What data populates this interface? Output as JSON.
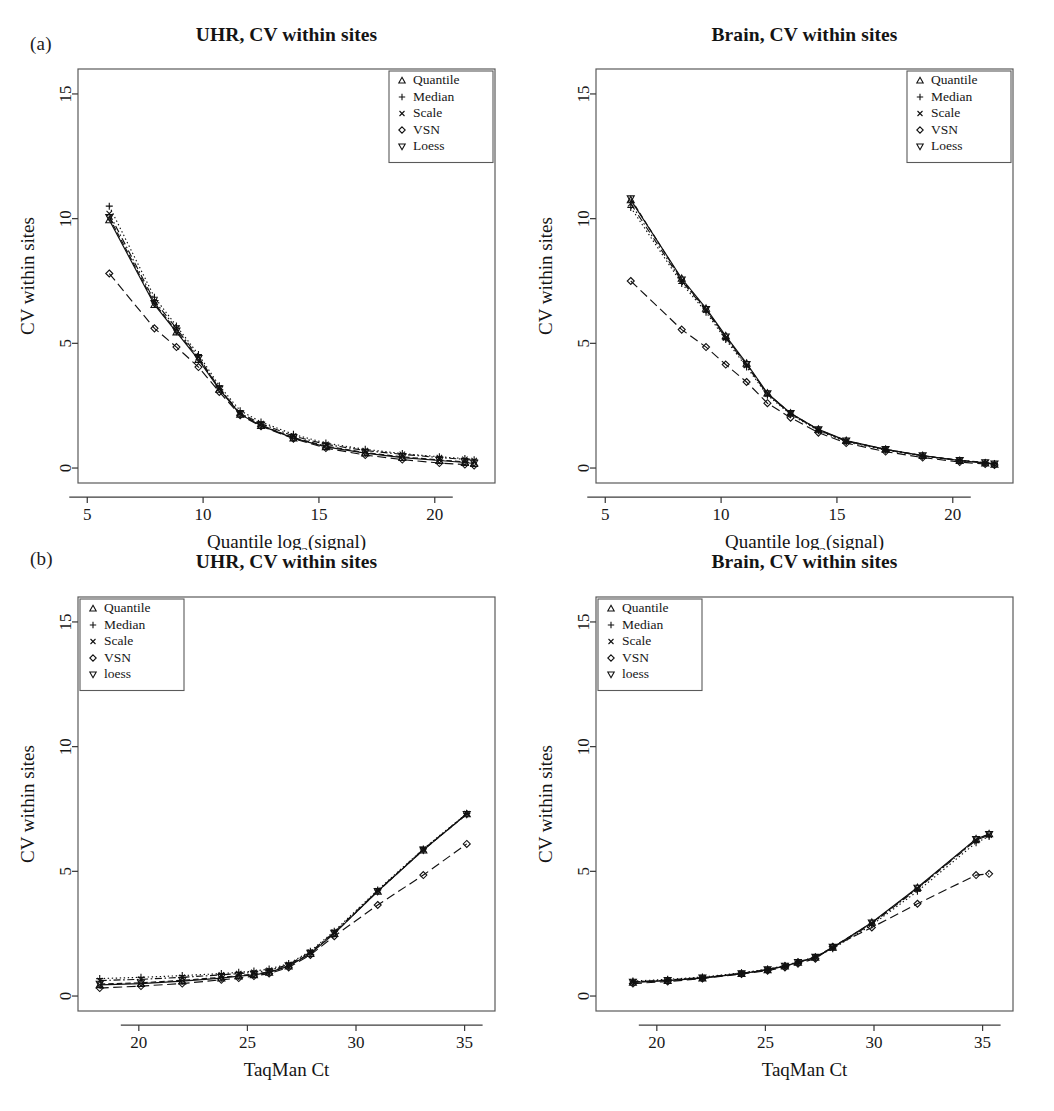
{
  "figure": {
    "panels": [
      {
        "tag": "(a)",
        "plots": [
          {
            "title": "UHR, CV within sites",
            "legend_position": "top-right",
            "chart_ref": 0
          },
          {
            "title": "Brain, CV within sites",
            "legend_position": "top-right",
            "chart_ref": 1
          }
        ]
      },
      {
        "tag": "(b)",
        "plots": [
          {
            "title": "UHR, CV within sites",
            "legend_position": "top-left",
            "chart_ref": 2
          },
          {
            "title": "Brain, CV within sites",
            "legend_position": "top-left",
            "chart_ref": 3
          }
        ]
      }
    ]
  },
  "axis_titles": {
    "y": "CV within sites",
    "x_panel_a_pre": "Quantile log",
    "x_panel_a_sub": "2",
    "x_panel_a_post": "(signal)",
    "x_panel_b": "TaqMan Ct"
  },
  "legend_glyphs": {
    "Quantile": "triangle-up",
    "Median": "plus",
    "Scale": "cross",
    "VSN": "diamond",
    "Loess": "triangle-down",
    "loess": "triangle-down"
  },
  "chart_data": [
    {
      "type": "line",
      "title": "UHR, CV within sites",
      "xlabel": "Quantile log2(signal)",
      "ylabel": "CV within sites",
      "xlim": [
        4.6,
        22.6
      ],
      "ylim": [
        -0.6,
        16.0
      ],
      "xticks": [
        5,
        10,
        15,
        20
      ],
      "yticks": [
        0,
        5,
        10,
        15
      ],
      "grid": false,
      "legend_position": "top-right",
      "series": [
        {
          "name": "Quantile",
          "marker": "triangle-up",
          "dash": "solid",
          "x": [
            5.95,
            7.9,
            8.85,
            9.8,
            10.7,
            11.6,
            12.5,
            13.9,
            15.3,
            17.0,
            18.6,
            20.2,
            21.3,
            21.7
          ],
          "y": [
            9.95,
            6.55,
            5.45,
            4.35,
            3.15,
            2.15,
            1.7,
            1.2,
            0.85,
            0.6,
            0.42,
            0.3,
            0.22,
            0.18
          ]
        },
        {
          "name": "Median",
          "marker": "plus",
          "dash": "dotted",
          "x": [
            5.95,
            7.9,
            8.85,
            9.8,
            10.7,
            11.6,
            12.5,
            13.9,
            15.3,
            17.0,
            18.6,
            20.2,
            21.3,
            21.7
          ],
          "y": [
            10.5,
            6.85,
            5.7,
            4.55,
            3.3,
            2.3,
            1.85,
            1.35,
            1.0,
            0.75,
            0.58,
            0.45,
            0.38,
            0.33
          ]
        },
        {
          "name": "Scale",
          "marker": "cross",
          "dash": "dashdot",
          "x": [
            5.95,
            7.9,
            8.85,
            9.8,
            10.7,
            11.6,
            12.5,
            13.9,
            15.3,
            17.0,
            18.6,
            20.2,
            21.3,
            21.7
          ],
          "y": [
            10.2,
            6.7,
            5.6,
            4.45,
            3.2,
            2.2,
            1.78,
            1.28,
            0.95,
            0.7,
            0.55,
            0.42,
            0.35,
            0.3
          ]
        },
        {
          "name": "VSN",
          "marker": "diamond",
          "dash": "longdash",
          "x": [
            5.95,
            7.9,
            8.85,
            9.8,
            10.7,
            11.6,
            12.5,
            13.9,
            15.3,
            17.0,
            18.6,
            20.2,
            21.3,
            21.7
          ],
          "y": [
            7.8,
            5.6,
            4.85,
            4.05,
            3.05,
            2.12,
            1.68,
            1.18,
            0.8,
            0.52,
            0.34,
            0.2,
            0.14,
            0.1
          ]
        },
        {
          "name": "Loess",
          "marker": "triangle-down",
          "dash": "dashed",
          "x": [
            5.95,
            7.9,
            8.85,
            9.8,
            10.7,
            11.6,
            12.5,
            13.9,
            15.3,
            17.0,
            18.6,
            20.2,
            21.3,
            21.7
          ],
          "y": [
            10.05,
            6.6,
            5.5,
            4.4,
            3.18,
            2.17,
            1.72,
            1.22,
            0.88,
            0.62,
            0.45,
            0.32,
            0.25,
            0.2
          ]
        }
      ]
    },
    {
      "type": "line",
      "title": "Brain, CV within sites",
      "xlabel": "Quantile log2(signal)",
      "ylabel": "CV within sites",
      "xlim": [
        4.6,
        22.6
      ],
      "ylim": [
        -0.6,
        16.0
      ],
      "xticks": [
        5,
        10,
        15,
        20
      ],
      "yticks": [
        0,
        5,
        10,
        15
      ],
      "grid": false,
      "legend_position": "top-right",
      "series": [
        {
          "name": "Quantile",
          "marker": "triangle-up",
          "dash": "solid",
          "x": [
            6.1,
            8.3,
            9.35,
            10.2,
            11.1,
            12.0,
            13.0,
            14.2,
            15.4,
            17.1,
            18.7,
            20.3,
            21.4,
            21.8
          ],
          "y": [
            10.75,
            7.6,
            6.4,
            5.3,
            4.2,
            3.0,
            2.2,
            1.55,
            1.1,
            0.75,
            0.5,
            0.3,
            0.2,
            0.15
          ]
        },
        {
          "name": "Median",
          "marker": "plus",
          "dash": "dotted",
          "x": [
            6.1,
            8.3,
            9.35,
            10.2,
            11.1,
            12.0,
            13.0,
            14.2,
            15.4,
            17.1,
            18.7,
            20.3,
            21.4,
            21.8
          ],
          "y": [
            10.45,
            7.4,
            6.25,
            5.15,
            4.05,
            2.92,
            2.15,
            1.5,
            1.05,
            0.72,
            0.48,
            0.3,
            0.22,
            0.18
          ]
        },
        {
          "name": "Scale",
          "marker": "cross",
          "dash": "dashdot",
          "x": [
            6.1,
            8.3,
            9.35,
            10.2,
            11.1,
            12.0,
            13.0,
            14.2,
            15.4,
            17.1,
            18.7,
            20.3,
            21.4,
            21.8
          ],
          "y": [
            10.6,
            7.5,
            6.33,
            5.22,
            4.12,
            2.96,
            2.18,
            1.52,
            1.08,
            0.74,
            0.49,
            0.3,
            0.21,
            0.16
          ]
        },
        {
          "name": "VSN",
          "marker": "diamond",
          "dash": "longdash",
          "x": [
            6.1,
            8.3,
            9.35,
            10.2,
            11.1,
            12.0,
            13.0,
            14.2,
            15.4,
            17.1,
            18.7,
            20.3,
            21.4,
            21.8
          ],
          "y": [
            7.5,
            5.55,
            4.85,
            4.15,
            3.45,
            2.6,
            2.02,
            1.42,
            1.0,
            0.66,
            0.42,
            0.24,
            0.16,
            0.12
          ]
        },
        {
          "name": "Loess",
          "marker": "triangle-down",
          "dash": "dashed",
          "x": [
            6.1,
            8.3,
            9.35,
            10.2,
            11.1,
            12.0,
            13.0,
            14.2,
            15.4,
            17.1,
            18.7,
            20.3,
            21.4,
            21.8
          ],
          "y": [
            10.8,
            7.55,
            6.36,
            5.26,
            4.16,
            2.98,
            2.19,
            1.54,
            1.09,
            0.75,
            0.5,
            0.31,
            0.22,
            0.17
          ]
        }
      ]
    },
    {
      "type": "line",
      "title": "UHR, CV within sites",
      "xlabel": "TaqMan Ct",
      "ylabel": "CV within sites",
      "xlim": [
        17.2,
        36.4
      ],
      "ylim": [
        -0.6,
        16.0
      ],
      "xticks": [
        20,
        25,
        30,
        35
      ],
      "yticks": [
        0,
        5,
        10,
        15
      ],
      "grid": false,
      "legend_position": "top-left",
      "series": [
        {
          "name": "Quantile",
          "marker": "triangle-up",
          "dash": "solid",
          "x": [
            18.2,
            20.1,
            22.0,
            23.8,
            24.6,
            25.3,
            26.0,
            26.9,
            27.9,
            29.0,
            31.0,
            33.1,
            35.1
          ],
          "y": [
            0.45,
            0.5,
            0.6,
            0.72,
            0.8,
            0.85,
            0.95,
            1.2,
            1.7,
            2.5,
            4.2,
            5.85,
            7.3
          ]
        },
        {
          "name": "Median",
          "marker": "plus",
          "dash": "dotted",
          "x": [
            18.2,
            20.1,
            22.0,
            23.8,
            24.6,
            25.3,
            26.0,
            26.9,
            27.9,
            29.0,
            31.0,
            33.1,
            35.1
          ],
          "y": [
            0.7,
            0.75,
            0.82,
            0.9,
            0.95,
            1.0,
            1.08,
            1.3,
            1.8,
            2.6,
            4.25,
            5.9,
            7.32
          ]
        },
        {
          "name": "Scale",
          "marker": "cross",
          "dash": "dashdot",
          "x": [
            18.2,
            20.1,
            22.0,
            23.8,
            24.6,
            25.3,
            26.0,
            26.9,
            27.9,
            29.0,
            31.0,
            33.1,
            35.1
          ],
          "y": [
            0.62,
            0.67,
            0.75,
            0.85,
            0.9,
            0.95,
            1.03,
            1.26,
            1.76,
            2.56,
            4.22,
            5.88,
            7.31
          ]
        },
        {
          "name": "VSN",
          "marker": "diamond",
          "dash": "longdash",
          "x": [
            18.2,
            20.1,
            22.0,
            23.8,
            24.6,
            25.3,
            26.0,
            26.9,
            27.9,
            29.0,
            31.0,
            33.1,
            35.1
          ],
          "y": [
            0.32,
            0.4,
            0.5,
            0.65,
            0.72,
            0.8,
            0.9,
            1.15,
            1.65,
            2.4,
            3.65,
            4.85,
            6.1
          ]
        },
        {
          "name": "loess",
          "marker": "triangle-down",
          "dash": "dashed",
          "x": [
            18.2,
            20.1,
            22.0,
            23.8,
            24.6,
            25.3,
            26.0,
            26.9,
            27.9,
            29.0,
            31.0,
            33.1,
            35.1
          ],
          "y": [
            0.48,
            0.53,
            0.63,
            0.75,
            0.82,
            0.88,
            0.97,
            1.22,
            1.72,
            2.52,
            4.2,
            5.86,
            7.29
          ]
        }
      ]
    },
    {
      "type": "line",
      "title": "Brain, CV within sites",
      "xlabel": "TaqMan Ct",
      "ylabel": "CV within sites",
      "xlim": [
        17.2,
        36.4
      ],
      "ylim": [
        -0.6,
        16.0
      ],
      "xticks": [
        20,
        25,
        30,
        35
      ],
      "yticks": [
        0,
        5,
        10,
        15
      ],
      "grid": false,
      "legend_position": "top-left",
      "series": [
        {
          "name": "Quantile",
          "marker": "triangle-up",
          "dash": "solid",
          "x": [
            18.9,
            20.5,
            22.1,
            23.9,
            25.1,
            25.9,
            26.5,
            27.3,
            28.1,
            29.9,
            32.0,
            34.7,
            35.3
          ],
          "y": [
            0.55,
            0.62,
            0.72,
            0.9,
            1.05,
            1.2,
            1.35,
            1.55,
            1.95,
            2.95,
            4.35,
            6.3,
            6.5
          ]
        },
        {
          "name": "Median",
          "marker": "plus",
          "dash": "dotted",
          "x": [
            18.9,
            20.5,
            22.1,
            23.9,
            25.1,
            25.9,
            26.5,
            27.3,
            28.1,
            29.9,
            32.0,
            34.7,
            35.3
          ],
          "y": [
            0.6,
            0.67,
            0.76,
            0.93,
            1.08,
            1.22,
            1.37,
            1.57,
            1.9,
            2.85,
            4.2,
            6.15,
            6.4
          ]
        },
        {
          "name": "Scale",
          "marker": "cross",
          "dash": "dashdot",
          "x": [
            18.9,
            20.5,
            22.1,
            23.9,
            25.1,
            25.9,
            26.5,
            27.3,
            28.1,
            29.9,
            32.0,
            34.7,
            35.3
          ],
          "y": [
            0.57,
            0.64,
            0.74,
            0.91,
            1.06,
            1.21,
            1.36,
            1.56,
            1.93,
            2.9,
            4.3,
            6.25,
            6.45
          ]
        },
        {
          "name": "VSN",
          "marker": "diamond",
          "dash": "longdash",
          "x": [
            18.9,
            20.5,
            22.1,
            23.9,
            25.1,
            25.9,
            26.5,
            27.3,
            28.1,
            29.9,
            32.0,
            34.7,
            35.3
          ],
          "y": [
            0.5,
            0.58,
            0.7,
            0.88,
            1.02,
            1.15,
            1.3,
            1.5,
            1.98,
            2.75,
            3.7,
            4.85,
            4.9
          ]
        },
        {
          "name": "loess",
          "marker": "triangle-down",
          "dash": "dashed",
          "x": [
            18.9,
            20.5,
            22.1,
            23.9,
            25.1,
            25.9,
            26.5,
            27.3,
            28.1,
            29.9,
            32.0,
            34.7,
            35.3
          ],
          "y": [
            0.56,
            0.63,
            0.73,
            0.9,
            1.06,
            1.2,
            1.35,
            1.56,
            1.96,
            2.93,
            4.33,
            6.28,
            6.48
          ]
        }
      ]
    }
  ],
  "legends": [
    [
      "Quantile",
      "Median",
      "Scale",
      "VSN",
      "Loess"
    ],
    [
      "Quantile",
      "Median",
      "Scale",
      "VSN",
      "Loess"
    ],
    [
      "Quantile",
      "Median",
      "Scale",
      "VSN",
      "loess"
    ],
    [
      "Quantile",
      "Median",
      "Scale",
      "VSN",
      "loess"
    ]
  ]
}
